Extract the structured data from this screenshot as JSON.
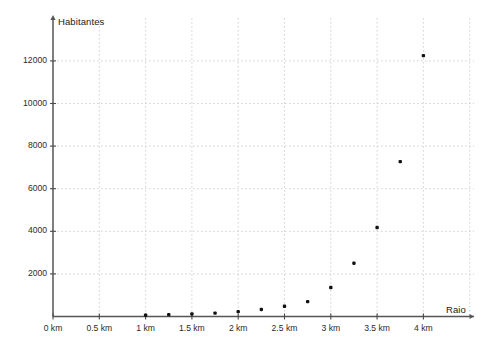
{
  "chart_data": {
    "type": "scatter",
    "title": "",
    "xlabel": "Raio",
    "ylabel": "Habitantes",
    "xlim": [
      0,
      4.35
    ],
    "ylim": [
      0,
      13300
    ],
    "grid": true,
    "legend": null,
    "x_tick_labels": [
      "0 km",
      "0.5 km",
      "1 km",
      "1.5 km",
      "2 km",
      "2.5 km",
      "3 km",
      "3.5 km",
      "4 km"
    ],
    "x_tick_values": [
      0,
      0.5,
      1,
      1.5,
      2,
      2.5,
      3,
      3.5,
      4
    ],
    "y_tick_labels": [
      "2000",
      "4000",
      "6000",
      "8000",
      "10000",
      "12000"
    ],
    "y_tick_values": [
      2000,
      4000,
      6000,
      8000,
      10000,
      12000
    ],
    "x": [
      1,
      1.25,
      1.5,
      1.75,
      2,
      2.25,
      2.5,
      2.75,
      3,
      3.25,
      3.5,
      3.75,
      4
    ],
    "values": [
      60,
      90,
      120,
      160,
      230,
      330,
      480,
      700,
      1360,
      2500,
      4175,
      7270,
      12250
    ],
    "point_color": "#111111",
    "grid_color": "#c8c8c8",
    "axis_color": "#555555"
  },
  "axes": {
    "y_title": "Habitantes",
    "x_title": "Raio"
  }
}
